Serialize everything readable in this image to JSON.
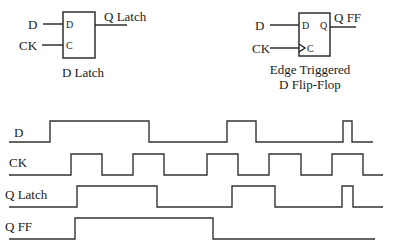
{
  "latch": {
    "input_d": "D",
    "input_ck": "CK",
    "pin_d": "D",
    "pin_c": "C",
    "output": "Q Latch",
    "caption": "D Latch"
  },
  "flipflop": {
    "input_d": "D",
    "input_ck": "CK",
    "pin_d": "D",
    "pin_c": "C",
    "pin_q": "Q",
    "output": "Q FF",
    "caption_line1": "Edge Triggered",
    "caption_line2": "D Flip-Flop"
  },
  "timing": {
    "signals": [
      {
        "name": "D",
        "label": "D",
        "high_y": 121,
        "low_y": 142,
        "label_y": 137,
        "points": "9,142 50,142 50,121 149,121 149,142 227,142 227,121 256,121 256,142 343,142 343,121 352,121 352,142 373,142"
      },
      {
        "name": "CK",
        "label": "CK",
        "high_y": 154,
        "low_y": 175,
        "label_y": 167,
        "points": "9,175 71,175 71,154 102,154 102,175 133,175 133,154 164,154 164,175 207,175 207,154 238,154 238,175 269,175 269,154 301,154 301,175 332,175 332,154 363,154 363,175 383,175"
      },
      {
        "name": "Q Latch",
        "label": "Q Latch",
        "high_y": 186,
        "low_y": 207,
        "label_y": 197,
        "points": "9,207 77,207 77,186 157,186 157,207 232,207 232,186 275,186 275,207 342,207 342,186 353,186 353,207 383,207"
      },
      {
        "name": "Q FF",
        "label": "Q FF",
        "high_y": 218,
        "low_y": 239,
        "label_y": 230,
        "points": "9,239 75,239 75,218 213,218 213,239 375,239"
      }
    ]
  }
}
